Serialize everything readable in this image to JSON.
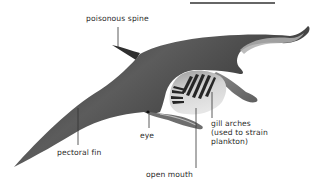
{
  "diagram": {
    "labels": {
      "poisonous_spine": "poisonous spine",
      "gill_arches": "gill arches\n(used to strain\nplankton)",
      "eye": "eye",
      "pectoral_fin": "pectoral fin",
      "open_mouth": "open mouth"
    },
    "colors": {
      "body_dark": "#3a3a3a",
      "body_mid": "#5a5a5a",
      "underside": "#b8b8b8",
      "mouth_interior": "#cfcfcf",
      "gill_bars": "#2a2a2a",
      "leader_line": "#333333",
      "label_text": "#2b2b2b",
      "top_rule": "#333333"
    }
  }
}
